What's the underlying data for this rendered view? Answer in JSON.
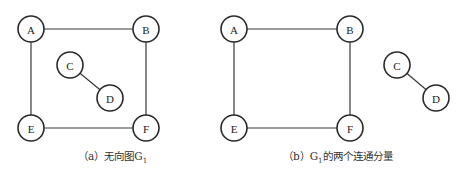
{
  "figures": [
    {
      "id": "a",
      "caption_prefix": "（a）无向图G",
      "caption_sub": "1",
      "caption_suffix": "",
      "nodes": [
        "A",
        "B",
        "C",
        "D",
        "E",
        "F"
      ],
      "edges": [
        [
          "A",
          "B"
        ],
        [
          "A",
          "E"
        ],
        [
          "B",
          "F"
        ],
        [
          "E",
          "F"
        ],
        [
          "C",
          "D"
        ]
      ]
    },
    {
      "id": "b",
      "caption_prefix": "（b）G",
      "caption_sub": "1",
      "caption_suffix": "的两个连通分量",
      "nodes": [
        "A",
        "B",
        "E",
        "F",
        "C",
        "D"
      ],
      "edges": [
        [
          "A",
          "B"
        ],
        [
          "A",
          "E"
        ],
        [
          "B",
          "F"
        ],
        [
          "E",
          "F"
        ],
        [
          "C",
          "D"
        ]
      ]
    }
  ]
}
